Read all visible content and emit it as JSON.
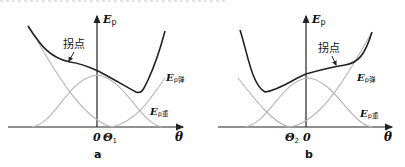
{
  "panels": [
    {
      "id": "a",
      "caption": "a",
      "y_axis_label": "E",
      "y_axis_sub": "p",
      "x_axis_label": "θ",
      "origin_label": "0",
      "theta_marker": "Θ",
      "theta_marker_sub": "1",
      "inflection_label": "拐点",
      "curve_labels": [
        {
          "main": "E",
          "sub": "p弹"
        },
        {
          "main": "E",
          "sub": "p重"
        }
      ]
    },
    {
      "id": "b",
      "caption": "b",
      "y_axis_label": "E",
      "y_axis_sub": "p",
      "x_axis_label": "θ",
      "origin_label": "0",
      "theta_marker": "Θ",
      "theta_marker_sub": "2",
      "inflection_label": "拐点",
      "curve_labels": [
        {
          "main": "E",
          "sub": "p弹"
        },
        {
          "main": "E",
          "sub": "p重"
        }
      ]
    }
  ],
  "colors": {
    "total_curve": "#222222",
    "component_curves": "#b5b5b5",
    "axes": "#222222"
  }
}
